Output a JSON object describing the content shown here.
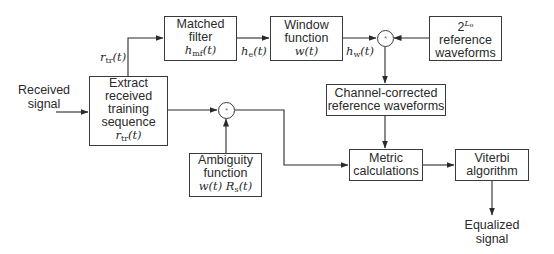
{
  "diagram": {
    "type": "block-diagram",
    "input_label": [
      "Received",
      "signal"
    ],
    "output_label": [
      "Equalized",
      "signal"
    ],
    "blocks": {
      "extract": {
        "lines": [
          "Extract",
          "received",
          "training",
          "sequence"
        ],
        "math": "r",
        "math_sub": "tr",
        "math_tail": "(t)"
      },
      "matched_filter": {
        "lines": [
          "Matched",
          "filter"
        ],
        "math": "h",
        "math_sub": "mf",
        "math_tail": "(t)"
      },
      "window_function": {
        "lines": [
          "Window",
          "function"
        ],
        "math": "w(t)"
      },
      "reference_waveforms": {
        "math_base": "2",
        "math_sup": "L",
        "math_sup_sub": "o",
        "lines": [
          "reference",
          "waveforms"
        ]
      },
      "channel_corrected": {
        "lines": [
          "Channel-corrected",
          "reference waveforms"
        ]
      },
      "ambiguity": {
        "lines": [
          "Ambiguity",
          "function"
        ],
        "math": "w(t) R",
        "math_sub": "s",
        "math_tail": "(t)"
      },
      "metric": {
        "lines": [
          "Metric",
          "calculations"
        ]
      },
      "viterbi": {
        "lines": [
          "Viterbi",
          "algorithm"
        ]
      }
    },
    "operators": {
      "convolution_1": "*",
      "convolution_2": "*"
    },
    "signals": {
      "r_tr": {
        "base": "r",
        "sub": "tr",
        "tail": "(t)"
      },
      "h_e": {
        "base": "h",
        "sub": "e",
        "tail": "(t)"
      },
      "h_w": {
        "base": "h",
        "sub": "w",
        "tail": "(t)"
      }
    }
  }
}
